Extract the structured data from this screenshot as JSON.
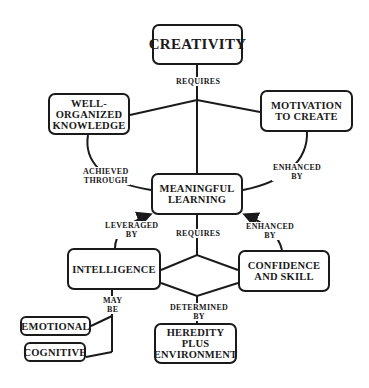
{
  "nodes": {
    "creativity": "CREATIVITY",
    "knowledge": "WELL-\nORGANIZED\nKNOWLEDGE",
    "motivation": "MOTIVATION\nTO CREATE",
    "learning": "MEANINGFUL\nLEARNING",
    "intelligence": "INTELLIGENCE",
    "confidence": "CONFIDENCE\nAND SKILL",
    "emotional": "EMOTIONAL",
    "cognitive": "COGNITIVE",
    "heredity": "HEREDITY\nPLUS\nENVIRONMENT"
  },
  "links": {
    "creativity_requires": "REQUIRES",
    "knowledge_achieved": "ACHIEVED\nTHROUGH",
    "motivation_enhanced": "ENHANCED\nBY",
    "intelligence_leveraged": "LEVERAGED\nBY",
    "learning_requires": "REQUIRES",
    "confidence_enhanced": "ENHANCED\nBY",
    "intelligence_may_be": "MAY\nBE",
    "determined_by": "DETERMINED\nBY"
  }
}
